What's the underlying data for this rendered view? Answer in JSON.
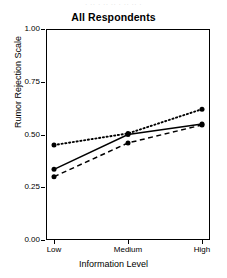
{
  "figure": {
    "width": 227,
    "height": 278,
    "background": "#ffffff",
    "ink_color": "#000000",
    "top_artifact_text": "· ·· · ·· ·· · ·· ·· ·"
  },
  "chart_data": {
    "type": "line",
    "title": "All Respondents",
    "xlabel": "Information Level",
    "ylabel": "Rumor Rejection Scale",
    "categories": [
      "Low",
      "Medium",
      "High"
    ],
    "x": [
      0,
      1,
      2
    ],
    "ylim": [
      0.0,
      1.0
    ],
    "yticks": [
      0.0,
      0.25,
      0.5,
      0.75,
      1.0
    ],
    "ytick_labels": [
      "0.00",
      "0.25",
      "0.50",
      "0.75",
      "1.00"
    ],
    "xtick_labels": [
      "Low",
      "Medium",
      "High"
    ],
    "grid": false,
    "legend": "none",
    "marker": "filled-circle",
    "marker_color": "#000000",
    "series": [
      {
        "name": "series-dotted",
        "linestyle": "dotted",
        "color": "#000000",
        "values": [
          0.45,
          0.505,
          0.62
        ]
      },
      {
        "name": "series-solid",
        "linestyle": "solid",
        "color": "#000000",
        "values": [
          0.335,
          0.5,
          0.55
        ]
      },
      {
        "name": "series-dashed",
        "linestyle": "dashed",
        "color": "#000000",
        "values": [
          0.3,
          0.46,
          0.545
        ]
      }
    ]
  }
}
